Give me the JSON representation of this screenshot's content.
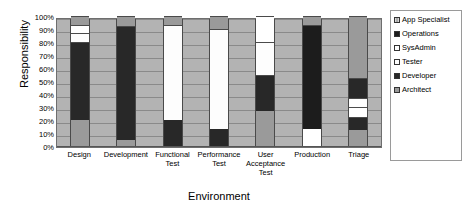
{
  "chart_data": {
    "type": "bar",
    "stacked": true,
    "stack_mode": "percent",
    "title": "",
    "xlabel": "Environment",
    "ylabel": "Responsibility",
    "ylim": [
      0,
      100
    ],
    "ytick_labels": [
      "100%",
      "90%",
      "80%",
      "70%",
      "60%",
      "50%",
      "40%",
      "30%",
      "20%",
      "10%",
      "0%"
    ],
    "ytick_values": [
      100,
      90,
      80,
      70,
      60,
      50,
      40,
      30,
      20,
      10,
      0
    ],
    "grid": true,
    "legend_position": "right",
    "categories": [
      "Design",
      "Development",
      "Functional Test",
      "Performance Test",
      "User Acceptance Test",
      "Production",
      "Triage"
    ],
    "series": [
      {
        "name": "App Specialist",
        "color": "#a8a8a8",
        "values": [
          0,
          0,
          0,
          0,
          0,
          0,
          0
        ]
      },
      {
        "name": "Operations",
        "color": "#1c1c1c",
        "values": [
          0,
          0,
          0,
          0,
          0,
          80,
          0
        ]
      },
      {
        "name": "SysAdmin",
        "color": "#ffffff",
        "values": [
          6,
          0,
          0,
          0,
          20,
          13,
          8
        ]
      },
      {
        "name": "Tester",
        "color": "#fdfdfd",
        "values": [
          7,
          0,
          73,
          77,
          25,
          0,
          8
        ]
      },
      {
        "name": "Developer",
        "color": "#282828",
        "values": [
          60,
          87,
          20,
          13,
          28,
          0,
          25
        ]
      },
      {
        "name": "Architect",
        "color": "#9a9a9a",
        "values": [
          27,
          13,
          7,
          10,
          27,
          7,
          59
        ]
      }
    ],
    "bars": [
      {
        "category": "Design",
        "segments": [
          {
            "series": "Architect",
            "start": 0,
            "end": 20
          },
          {
            "series": "Developer",
            "start": 20,
            "end": 80
          },
          {
            "series": "Tester",
            "start": 80,
            "end": 87
          },
          {
            "series": "SysAdmin",
            "start": 87,
            "end": 93
          },
          {
            "series": "Architect",
            "start": 93,
            "end": 100
          }
        ]
      },
      {
        "category": "Development",
        "segments": [
          {
            "series": "Architect",
            "start": 0,
            "end": 5
          },
          {
            "series": "Developer",
            "start": 5,
            "end": 92
          },
          {
            "series": "Architect",
            "start": 92,
            "end": 100
          }
        ]
      },
      {
        "category": "Functional Test",
        "segments": [
          {
            "series": "Developer",
            "start": 0,
            "end": 20
          },
          {
            "series": "Tester",
            "start": 20,
            "end": 93
          },
          {
            "series": "Architect",
            "start": 93,
            "end": 100
          }
        ]
      },
      {
        "category": "Performance Test",
        "segments": [
          {
            "series": "Developer",
            "start": 0,
            "end": 13
          },
          {
            "series": "Tester",
            "start": 13,
            "end": 90
          },
          {
            "series": "Architect",
            "start": 90,
            "end": 100
          }
        ]
      },
      {
        "category": "User Acceptance Test",
        "segments": [
          {
            "series": "Architect",
            "start": 0,
            "end": 27
          },
          {
            "series": "Developer",
            "start": 27,
            "end": 55
          },
          {
            "series": "Tester",
            "start": 55,
            "end": 80
          },
          {
            "series": "SysAdmin",
            "start": 80,
            "end": 100
          }
        ]
      },
      {
        "category": "Production",
        "segments": [
          {
            "series": "SysAdmin",
            "start": 0,
            "end": 13
          },
          {
            "series": "Operations",
            "start": 13,
            "end": 93
          },
          {
            "series": "Architect",
            "start": 93,
            "end": 100
          }
        ]
      },
      {
        "category": "Triage",
        "segments": [
          {
            "series": "Architect",
            "start": 0,
            "end": 12
          },
          {
            "series": "Developer",
            "start": 12,
            "end": 22
          },
          {
            "series": "SysAdmin",
            "start": 22,
            "end": 30
          },
          {
            "series": "Tester",
            "start": 30,
            "end": 37
          },
          {
            "series": "Developer",
            "start": 37,
            "end": 52
          },
          {
            "series": "Architect",
            "start": 52,
            "end": 100
          }
        ]
      }
    ]
  },
  "legend": {
    "items": [
      {
        "label": "App Specialist",
        "color": "#a8a8a8",
        "fill_class": "fill-app-specialist"
      },
      {
        "label": "Operations",
        "color": "#1c1c1c",
        "fill_class": "fill-operations"
      },
      {
        "label": "SysAdmin",
        "color": "#ffffff",
        "fill_class": "fill-sysadmin"
      },
      {
        "label": "Tester",
        "color": "#fdfdfd",
        "fill_class": "fill-tester"
      },
      {
        "label": "Developer",
        "color": "#282828",
        "fill_class": "fill-developer"
      },
      {
        "label": "Architect",
        "color": "#9a9a9a",
        "fill_class": "fill-architect"
      }
    ]
  }
}
